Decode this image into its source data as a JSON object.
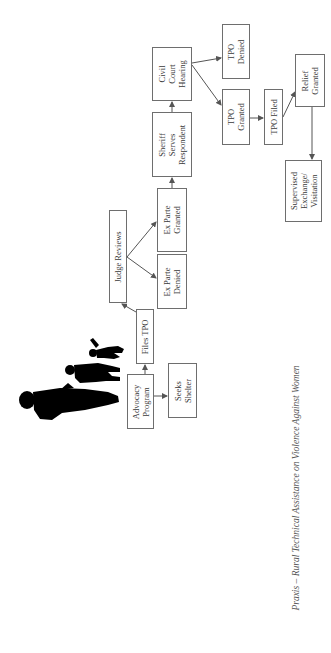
{
  "diagram": {
    "caption": "Praxis – Rural Technical Assistance on Violence Against Women",
    "colors": {
      "box_border": "#6e6e6e",
      "arrow": "#555555",
      "text": "#3a3a3a",
      "silhouette": "#000000"
    },
    "nodes": [
      {
        "id": "advocacy-program",
        "label": "Advocacy\nProgram",
        "x": 127,
        "y": 374,
        "w": 27,
        "h": 55
      },
      {
        "id": "seeks-shelter",
        "label": "Seeks\nShelter",
        "x": 168,
        "y": 363,
        "w": 29,
        "h": 55
      },
      {
        "id": "files-tpo",
        "label": "Files TPO",
        "x": 136,
        "y": 309,
        "w": 18,
        "h": 55
      },
      {
        "id": "judge-reviews",
        "label": "Judge Reviews",
        "x": 109,
        "y": 210,
        "w": 18,
        "h": 93
      },
      {
        "id": "ex-parte-denied",
        "label": "Ex Parte\nDenied",
        "x": 157,
        "y": 254,
        "w": 30,
        "h": 55
      },
      {
        "id": "ex-parte-granted",
        "label": "Ex Parte\nGranted",
        "x": 157,
        "y": 188,
        "w": 30,
        "h": 64
      },
      {
        "id": "sheriff-serves-respondent",
        "label": "Sheriff\nServes\nRespondent",
        "x": 152,
        "y": 112,
        "w": 40,
        "h": 65
      },
      {
        "id": "civil-court-hearing",
        "label": "Civil\nCourt\nHearing",
        "x": 152,
        "y": 47,
        "w": 40,
        "h": 54
      },
      {
        "id": "tpo-denied",
        "label": "TPO\nDenied",
        "x": 222,
        "y": 24,
        "w": 28,
        "h": 55
      },
      {
        "id": "tpo-granted",
        "label": "TPO\nGranted",
        "x": 222,
        "y": 89,
        "w": 28,
        "h": 56
      },
      {
        "id": "tpo-filed",
        "label": "TPO Filed",
        "x": 264,
        "y": 89,
        "w": 19,
        "h": 56
      },
      {
        "id": "relief-granted",
        "label": "Relief\nGranted",
        "x": 295,
        "y": 54,
        "w": 30,
        "h": 53
      },
      {
        "id": "supervised-exchange-visitation",
        "label": "Supervised\nExchange/\nVisitation",
        "x": 285,
        "y": 160,
        "w": 37,
        "h": 62
      }
    ],
    "edges": [
      {
        "from": "advocacy-program",
        "to": "seeks-shelter",
        "x1": 154,
        "y1": 396,
        "x2": 167,
        "y2": 396
      },
      {
        "from": "advocacy-program",
        "to": "files-tpo",
        "x1": 145,
        "y1": 374,
        "x2": 145,
        "y2": 365
      },
      {
        "from": "files-tpo",
        "to": "judge-reviews",
        "x1": 136,
        "y1": 312,
        "x2": 122,
        "y2": 304
      },
      {
        "from": "judge-reviews",
        "to": "ex-parte-denied",
        "x1": 127,
        "y1": 257,
        "x2": 156,
        "y2": 278
      },
      {
        "from": "judge-reviews",
        "to": "ex-parte-granted",
        "x1": 127,
        "y1": 257,
        "x2": 156,
        "y2": 222
      },
      {
        "from": "ex-parte-granted",
        "to": "sheriff-serves-respondent",
        "x1": 172,
        "y1": 188,
        "x2": 172,
        "y2": 178
      },
      {
        "from": "sheriff-serves-respondent",
        "to": "civil-court-hearing",
        "x1": 172,
        "y1": 112,
        "x2": 172,
        "y2": 102
      },
      {
        "from": "civil-court-hearing",
        "to": "tpo-denied",
        "x1": 192,
        "y1": 63,
        "x2": 221,
        "y2": 58
      },
      {
        "from": "civil-court-hearing",
        "to": "tpo-granted",
        "x1": 192,
        "y1": 65,
        "x2": 221,
        "y2": 105
      },
      {
        "from": "tpo-granted",
        "to": "tpo-filed",
        "x1": 250,
        "y1": 118,
        "x2": 263,
        "y2": 118
      },
      {
        "from": "tpo-filed",
        "to": "relief-granted",
        "x1": 283,
        "y1": 117,
        "x2": 295,
        "y2": 92
      },
      {
        "from": "relief-granted",
        "to": "supervised-exchange-visitation",
        "x1": 312,
        "y1": 107,
        "x2": 312,
        "y2": 159
      }
    ]
  }
}
